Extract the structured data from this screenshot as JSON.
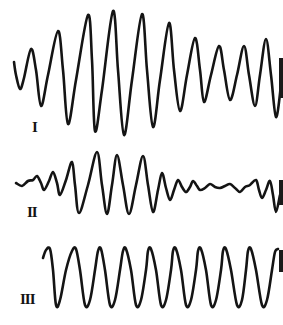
{
  "figure": {
    "stroke_color": "#141414",
    "background": "#ffffff",
    "traces": [
      {
        "id": "I",
        "label": "I",
        "label_pos": [
          32,
          120
        ],
        "points": [
          [
            14,
            62
          ],
          [
            16,
            75
          ],
          [
            20,
            89
          ],
          [
            24,
            78
          ],
          [
            31,
            49
          ],
          [
            36,
            70
          ],
          [
            41,
            106
          ],
          [
            48,
            75
          ],
          [
            58,
            31
          ],
          [
            63,
            70
          ],
          [
            68,
            124
          ],
          [
            76,
            80
          ],
          [
            88,
            15
          ],
          [
            92,
            60
          ],
          [
            95,
            131
          ],
          [
            102,
            90
          ],
          [
            113,
            11
          ],
          [
            118,
            70
          ],
          [
            124,
            135
          ],
          [
            132,
            80
          ],
          [
            142,
            14
          ],
          [
            147,
            70
          ],
          [
            153,
            127
          ],
          [
            160,
            80
          ],
          [
            169,
            23
          ],
          [
            174,
            70
          ],
          [
            180,
            111
          ],
          [
            187,
            75
          ],
          [
            195,
            38
          ],
          [
            200,
            70
          ],
          [
            204,
            102
          ],
          [
            211,
            75
          ],
          [
            219,
            46
          ],
          [
            224,
            70
          ],
          [
            230,
            100
          ],
          [
            237,
            75
          ],
          [
            244,
            46
          ],
          [
            249,
            75
          ],
          [
            255,
            106
          ],
          [
            260,
            75
          ],
          [
            266,
            39
          ],
          [
            271,
            75
          ],
          [
            276,
            117
          ],
          [
            281,
            85
          ]
        ]
      },
      {
        "id": "II",
        "label": "II",
        "label_pos": [
          27,
          205
        ],
        "points": [
          [
            16,
            183
          ],
          [
            22,
            186
          ],
          [
            28,
            181
          ],
          [
            33,
            180
          ],
          [
            37,
            176
          ],
          [
            41,
            183
          ],
          [
            44,
            190
          ],
          [
            49,
            181
          ],
          [
            53,
            172
          ],
          [
            57,
            183
          ],
          [
            60,
            195
          ],
          [
            66,
            180
          ],
          [
            72,
            162
          ],
          [
            75,
            185
          ],
          [
            79,
            213
          ],
          [
            88,
            185
          ],
          [
            97,
            152
          ],
          [
            102,
            185
          ],
          [
            107,
            214
          ],
          [
            112,
            185
          ],
          [
            117,
            155
          ],
          [
            123,
            185
          ],
          [
            129,
            214
          ],
          [
            136,
            185
          ],
          [
            143,
            156
          ],
          [
            148,
            185
          ],
          [
            153,
            212
          ],
          [
            158,
            190
          ],
          [
            162,
            173
          ],
          [
            166,
            188
          ],
          [
            170,
            200
          ],
          [
            174,
            190
          ],
          [
            178,
            180
          ],
          [
            182,
            187
          ],
          [
            186,
            192
          ],
          [
            190,
            187
          ],
          [
            193,
            181
          ],
          [
            197,
            186
          ],
          [
            200,
            190
          ],
          [
            205,
            188
          ],
          [
            210,
            184
          ],
          [
            215,
            187
          ],
          [
            220,
            188
          ],
          [
            225,
            186
          ],
          [
            230,
            184
          ],
          [
            235,
            188
          ],
          [
            240,
            192
          ],
          [
            245,
            187
          ],
          [
            250,
            185
          ],
          [
            256,
            180
          ],
          [
            259,
            190
          ],
          [
            262,
            198
          ],
          [
            266,
            190
          ],
          [
            270,
            181
          ],
          [
            273,
            195
          ],
          [
            276,
            212
          ],
          [
            280,
            195
          ]
        ]
      },
      {
        "id": "III",
        "label": "III",
        "label_pos": [
          20,
          292
        ],
        "points": [
          [
            43,
            258
          ],
          [
            46,
            250
          ],
          [
            50,
            249
          ],
          [
            53,
            270
          ],
          [
            56,
            305
          ],
          [
            60,
            300
          ],
          [
            66,
            270
          ],
          [
            72,
            251
          ],
          [
            76,
            249
          ],
          [
            80,
            270
          ],
          [
            85,
            305
          ],
          [
            90,
            300
          ],
          [
            95,
            270
          ],
          [
            98,
            251
          ],
          [
            101,
            249
          ],
          [
            105,
            270
          ],
          [
            110,
            305
          ],
          [
            115,
            300
          ],
          [
            120,
            270
          ],
          [
            123,
            251
          ],
          [
            126,
            249
          ],
          [
            131,
            270
          ],
          [
            136,
            305
          ],
          [
            141,
            300
          ],
          [
            146,
            270
          ],
          [
            148,
            251
          ],
          [
            151,
            249
          ],
          [
            156,
            270
          ],
          [
            161,
            305
          ],
          [
            166,
            300
          ],
          [
            171,
            270
          ],
          [
            173,
            251
          ],
          [
            176,
            249
          ],
          [
            181,
            270
          ],
          [
            186,
            305
          ],
          [
            191,
            300
          ],
          [
            196,
            270
          ],
          [
            198,
            251
          ],
          [
            201,
            249
          ],
          [
            206,
            270
          ],
          [
            211,
            305
          ],
          [
            216,
            300
          ],
          [
            221,
            270
          ],
          [
            223,
            251
          ],
          [
            226,
            249
          ],
          [
            231,
            270
          ],
          [
            237,
            305
          ],
          [
            242,
            300
          ],
          [
            246,
            270
          ],
          [
            248,
            251
          ],
          [
            251,
            249
          ],
          [
            256,
            270
          ],
          [
            262,
            305
          ],
          [
            267,
            300
          ],
          [
            272,
            270
          ],
          [
            275,
            252
          ],
          [
            278,
            249
          ]
        ]
      }
    ],
    "edge_marks": [
      {
        "top": 58,
        "height": 40
      },
      {
        "top": 180,
        "height": 25
      },
      {
        "top": 250,
        "height": 22
      }
    ]
  }
}
